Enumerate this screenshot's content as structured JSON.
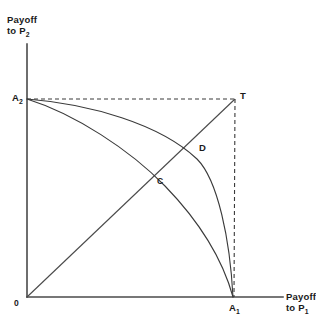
{
  "figure": {
    "background_color": "#ffffff",
    "line_color": "#3a3a3a",
    "axis_color": "#4a4a4a",
    "width": 316,
    "height": 331
  },
  "axes": {
    "y_label_line1": "Payoff",
    "y_label_line2": "to P",
    "y_label_sub": "2",
    "x_label_line1": "Payoff",
    "x_label_line2": "to P",
    "x_label_sub": "1",
    "origin_label": "0",
    "y_axis_top_y": 44,
    "y_axis_bottom_y": 297,
    "x_axis_left_x": 27,
    "x_axis_right_x": 283
  },
  "points": [
    {
      "id": "A2",
      "label": "A",
      "sub": "2",
      "x": 27,
      "y": 99,
      "note": "Payoff to P2 threat point on vertical axis"
    },
    {
      "id": "T",
      "label": "T",
      "sub": "",
      "x": 235,
      "y": 99,
      "note": "Threat point corner (A1, A2)"
    },
    {
      "id": "D",
      "label": "D",
      "sub": "",
      "x": 192,
      "y": 147,
      "note": "Intersection of outer bargaining frontier with diagonal"
    },
    {
      "id": "C",
      "label": "C",
      "sub": "",
      "x": 163,
      "y": 177,
      "note": "Intersection of inner curve with diagonal"
    },
    {
      "id": "A1",
      "label": "A",
      "sub": "1",
      "x": 233,
      "y": 297,
      "note": "Payoff to P1 threat point on horizontal axis"
    },
    {
      "id": "O",
      "label": "0",
      "sub": "",
      "x": 27,
      "y": 297,
      "note": "Origin"
    }
  ],
  "curves": [
    {
      "id": "outer-frontier",
      "style": "solid",
      "from": "A2",
      "to": "A1",
      "description": "Outer concave Pareto frontier from A2 to A1, passing through D"
    },
    {
      "id": "inner-frontier",
      "style": "solid",
      "from": "A2",
      "to": "A1",
      "description": "Inner concave curve from A2 to A1, passing through C"
    },
    {
      "id": "diagonal",
      "style": "solid",
      "from": "O",
      "to": "T",
      "description": "Equal-payoff 45 degree ray from origin through C and D to T"
    },
    {
      "id": "dashed-horizontal",
      "style": "dashed",
      "from": "A2",
      "to": "T",
      "description": "Dashed horizontal guide at the A2 level to T"
    },
    {
      "id": "dashed-vertical",
      "style": "dashed",
      "from": "T",
      "to": "A1",
      "description": "Dashed vertical guide from T down to A1"
    }
  ]
}
